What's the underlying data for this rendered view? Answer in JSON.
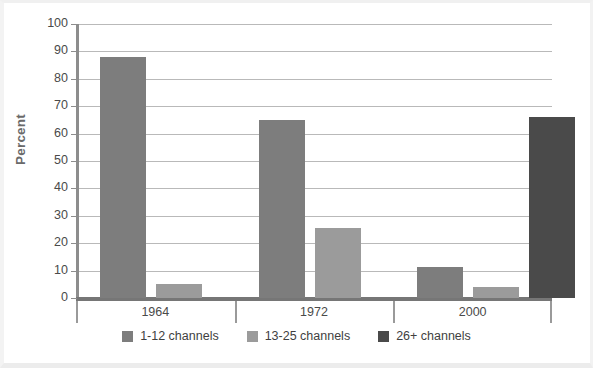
{
  "chart_data": {
    "type": "bar",
    "title": "",
    "subtitle": "",
    "xlabel": "",
    "ylabel": "Percent",
    "ylim": [
      0,
      100
    ],
    "ytick_step": 10,
    "yticks": [
      "100",
      "90",
      "80",
      "70",
      "60",
      "50",
      "40",
      "30",
      "20",
      "10",
      "0"
    ],
    "grid": true,
    "legend_position": "bottom",
    "categories": [
      "1964",
      "1972",
      "2000"
    ],
    "series": [
      {
        "name": "1-12 channels",
        "color": "#7d7d7d",
        "values": [
          88,
          65,
          11.5
        ]
      },
      {
        "name": "13-25 channels",
        "color": "#9b9b9b",
        "values": [
          5,
          25.5,
          4
        ]
      },
      {
        "name": "26+ channels",
        "color": "#4a4a4a",
        "values": [
          0,
          0,
          66
        ]
      }
    ]
  },
  "axis": {
    "y_title": "Percent",
    "y_labels": [
      "100",
      "90",
      "80",
      "70",
      "60",
      "50",
      "40",
      "30",
      "20",
      "10",
      "0"
    ],
    "x_labels": [
      "1964",
      "1972",
      "2000"
    ]
  },
  "legend": {
    "items": [
      {
        "label": "1-12 channels",
        "color": "#7d7d7d"
      },
      {
        "label": "13-25 channels",
        "color": "#9b9b9b"
      },
      {
        "label": "26+ channels",
        "color": "#4a4a4a"
      }
    ]
  },
  "colors": {
    "background": "#ffffff",
    "axis": "#808080",
    "gridline": "#b9b9b9",
    "text": "#4a4a4a",
    "series_1": "#7d7d7d",
    "series_2": "#9b9b9b",
    "series_3": "#4a4a4a"
  }
}
